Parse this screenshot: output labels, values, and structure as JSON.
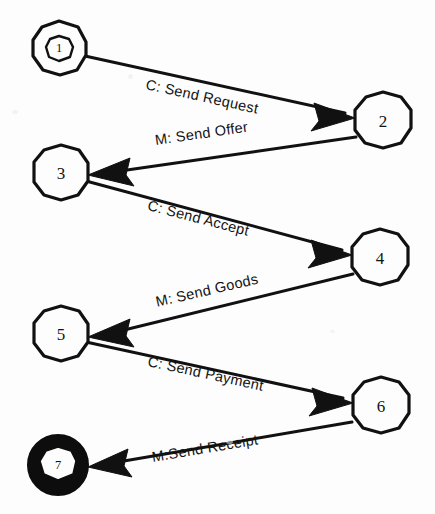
{
  "diagram": {
    "type": "state-machine",
    "canvas": {
      "width": 435,
      "height": 514,
      "background": "#fdfdfd"
    },
    "stroke_color": "#111111",
    "nodes": [
      {
        "id": "1",
        "label": "1",
        "kind": "initial-double-circle",
        "cx": 59,
        "cy": 48,
        "r": 27
      },
      {
        "id": "2",
        "label": "2",
        "kind": "circle",
        "cx": 383,
        "cy": 120,
        "r": 28
      },
      {
        "id": "3",
        "label": "3",
        "kind": "circle",
        "cx": 61,
        "cy": 172,
        "r": 27
      },
      {
        "id": "4",
        "label": "4",
        "kind": "circle",
        "cx": 380,
        "cy": 257,
        "r": 28
      },
      {
        "id": "5",
        "label": "5",
        "kind": "circle",
        "cx": 61,
        "cy": 333,
        "r": 27
      },
      {
        "id": "6",
        "label": "6",
        "kind": "circle",
        "cx": 381,
        "cy": 405,
        "r": 28
      },
      {
        "id": "7",
        "label": "7",
        "kind": "final-thick-circle",
        "cx": 58,
        "cy": 465,
        "r": 30
      }
    ],
    "edges": [
      {
        "id": "e1",
        "from": "1",
        "to": "2",
        "label": "C: Send Request",
        "direction": "left-to-right"
      },
      {
        "id": "e2",
        "from": "2",
        "to": "3",
        "label": "M: Send Offer",
        "direction": "right-to-left"
      },
      {
        "id": "e3",
        "from": "3",
        "to": "4",
        "label": "C: Send Accept",
        "direction": "left-to-right"
      },
      {
        "id": "e4",
        "from": "4",
        "to": "5",
        "label": "M: Send Goods",
        "direction": "right-to-left"
      },
      {
        "id": "e5",
        "from": "5",
        "to": "6",
        "label": "C: Send Payment",
        "direction": "left-to-right"
      },
      {
        "id": "e6",
        "from": "6",
        "to": "7",
        "label": "M:Send Receipt",
        "direction": "right-to-left"
      }
    ]
  }
}
